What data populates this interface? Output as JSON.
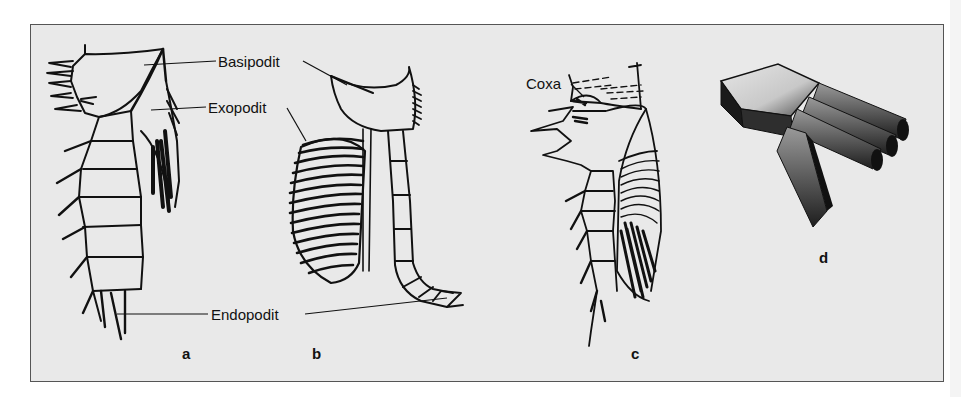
{
  "figure": {
    "background": "#e9e9e9",
    "border_color": "#555555",
    "ink_color": "#111111",
    "labels": {
      "basipodit": "Basipodit",
      "exopodit": "Exopodit",
      "endopodit": "Endopodit",
      "coxa": "Coxa"
    },
    "panels": [
      {
        "id": "a",
        "label": "a",
        "description": "biramous leg with setose exopodit and segmented endopodit"
      },
      {
        "id": "b",
        "label": "b",
        "description": "leg with broad ribbed exopodit and slender jointed endopodit"
      },
      {
        "id": "c",
        "label": "c",
        "description": "leg with coxa, spiny margin and striated exopodit"
      },
      {
        "id": "d",
        "label": "d",
        "description": "3D block model of a branching limb"
      }
    ]
  }
}
